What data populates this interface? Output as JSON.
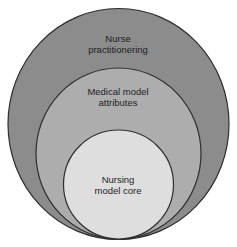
{
  "diagram": {
    "type": "nested-circles",
    "background": "#ffffff",
    "outline_color": "#2e2e2e",
    "circles": [
      {
        "id": "outer",
        "label_lines": [
          "Nurse",
          "practitionering"
        ],
        "fill": "#8c8c8c",
        "cx": 118.5,
        "cy": 124,
        "rx": 110.5,
        "ry": 115.5
      },
      {
        "id": "middle",
        "label_lines": [
          "Medical model",
          "attributes"
        ],
        "fill": "#adadad",
        "cx": 118.5,
        "cy": 153.5,
        "rx": 82.5,
        "ry": 85.5
      },
      {
        "id": "inner",
        "label_lines": [
          "Nursing",
          "model core"
        ],
        "fill": "#dedede",
        "cx": 118.5,
        "cy": 184.5,
        "rx": 55,
        "ry": 54.5
      }
    ]
  }
}
